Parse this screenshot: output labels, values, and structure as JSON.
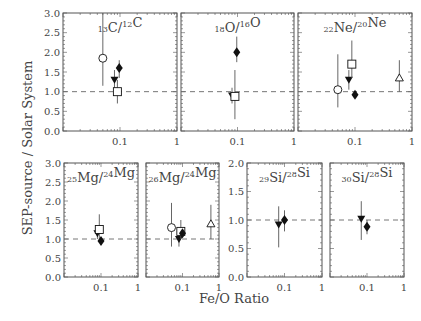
{
  "chart_data": {
    "type": "scatter",
    "ylabel": "SEP-source / Solar System",
    "xlabel": "Fe/O Ratio",
    "xscale": "log",
    "xlim": [
      0.01,
      1
    ],
    "x_tick_labels": [
      "0.1",
      "1"
    ],
    "grid": false,
    "reference_line": 1.0,
    "markers": {
      "open-circle": "open circle",
      "filled-triangle-down": "filled downward triangle",
      "open-square": "open square",
      "filled-diamond": "filled diamond",
      "open-triangle-up": "open upward triangle"
    },
    "panels": [
      {
        "id": "c13",
        "label_sup1": "13",
        "label_el1": "C",
        "label_sup2": "12",
        "label_el2": "C",
        "ylim": [
          0,
          3.0
        ],
        "y_ticks": [
          "0.0",
          "0.5",
          "1.0",
          "1.5",
          "2.0",
          "2.5",
          "3.0"
        ],
        "points": [
          {
            "marker": "open-circle",
            "x": 0.05,
            "y": 1.85,
            "ylo": 1.15,
            "yhi": 3.0
          },
          {
            "marker": "filled-triangle-down",
            "x": 0.08,
            "y": 1.3,
            "ylo": 1.05,
            "yhi": 1.55
          },
          {
            "marker": "open-square",
            "x": 0.09,
            "y": 1.0,
            "ylo": 0.7,
            "yhi": 1.3
          },
          {
            "marker": "filled-diamond",
            "x": 0.097,
            "y": 1.6,
            "ylo": 1.35,
            "yhi": 1.8
          }
        ]
      },
      {
        "id": "o18",
        "label_sup1": "18",
        "label_el1": "O",
        "label_sup2": "16",
        "label_el2": "O",
        "ylim": [
          0,
          3.0
        ],
        "y_ticks": [],
        "points": [
          {
            "marker": "filled-triangle-down",
            "x": 0.08,
            "y": 0.9,
            "ylo": 0.7,
            "yhi": 1.1
          },
          {
            "marker": "open-square",
            "x": 0.09,
            "y": 0.88,
            "ylo": 0.3,
            "yhi": 1.55
          },
          {
            "marker": "filled-diamond",
            "x": 0.097,
            "y": 2.0,
            "ylo": 1.75,
            "yhi": 2.4
          }
        ]
      },
      {
        "id": "ne22",
        "label_sup1": "22",
        "label_el1": "Ne",
        "label_sup2": "20",
        "label_el2": "Ne",
        "ylim": [
          0,
          3.0
        ],
        "y_ticks": [],
        "points": [
          {
            "marker": "open-circle",
            "x": 0.05,
            "y": 1.05,
            "ylo": 0.6,
            "yhi": 1.95
          },
          {
            "marker": "filled-triangle-down",
            "x": 0.078,
            "y": 1.3,
            "ylo": 1.05,
            "yhi": 1.55
          },
          {
            "marker": "open-square",
            "x": 0.088,
            "y": 1.7,
            "ylo": 1.35,
            "yhi": 2.3
          },
          {
            "marker": "filled-diamond",
            "x": 0.1,
            "y": 0.92,
            "ylo": 0.85,
            "yhi": 1.0
          },
          {
            "marker": "open-triangle-up",
            "x": 0.6,
            "y": 1.35,
            "ylo": 1.0,
            "yhi": 1.8
          }
        ]
      },
      {
        "id": "mg25",
        "label_sup1": "25",
        "label_el1": "Mg",
        "label_sup2": "24",
        "label_el2": "Mg",
        "ylim": [
          0,
          3.0
        ],
        "y_ticks": [
          "0.0",
          "0.5",
          "1.0",
          "1.5",
          "2.0",
          "2.5",
          "3.0"
        ],
        "points": [
          {
            "marker": "filled-triangle-down",
            "x": 0.08,
            "y": 1.15,
            "ylo": 1.0,
            "yhi": 1.3
          },
          {
            "marker": "open-square",
            "x": 0.09,
            "y": 1.25,
            "ylo": 0.95,
            "yhi": 1.65
          },
          {
            "marker": "filled-diamond",
            "x": 0.1,
            "y": 0.95,
            "ylo": 0.85,
            "yhi": 1.05
          }
        ]
      },
      {
        "id": "mg26",
        "label_sup1": "26",
        "label_el1": "Mg",
        "label_sup2": "24",
        "label_el2": "Mg",
        "ylim": [
          0,
          3.0
        ],
        "y_ticks": [],
        "points": [
          {
            "marker": "open-circle",
            "x": 0.05,
            "y": 1.3,
            "ylo": 0.8,
            "yhi": 1.95
          },
          {
            "marker": "filled-triangle-down",
            "x": 0.08,
            "y": 1.0,
            "ylo": 0.8,
            "yhi": 1.2
          },
          {
            "marker": "open-square",
            "x": 0.09,
            "y": 1.2,
            "ylo": 1.0,
            "yhi": 1.5
          },
          {
            "marker": "filled-diamond",
            "x": 0.1,
            "y": 1.15,
            "ylo": 1.05,
            "yhi": 1.25
          },
          {
            "marker": "open-triangle-up",
            "x": 0.6,
            "y": 1.4,
            "ylo": 1.0,
            "yhi": 1.9
          }
        ]
      },
      {
        "id": "si29",
        "label_sup1": "29",
        "label_el1": "Si",
        "label_sup2": "28",
        "label_el2": "Si",
        "ylim": [
          0,
          2.0
        ],
        "y_ticks": [
          "0.0",
          "0.5",
          "1.0",
          "1.5",
          "2.0"
        ],
        "points": [
          {
            "marker": "filled-triangle-down",
            "x": 0.07,
            "y": 0.92,
            "ylo": 0.52,
            "yhi": 1.24
          },
          {
            "marker": "filled-diamond",
            "x": 0.1,
            "y": 1.0,
            "ylo": 0.8,
            "yhi": 1.17
          }
        ]
      },
      {
        "id": "si30",
        "label_sup1": "30",
        "label_el1": "Si",
        "label_sup2": "28",
        "label_el2": "Si",
        "ylim": [
          0,
          2.0
        ],
        "y_ticks": [],
        "points": [
          {
            "marker": "filled-triangle-down",
            "x": 0.07,
            "y": 1.02,
            "ylo": 0.65,
            "yhi": 1.33
          },
          {
            "marker": "filled-diamond",
            "x": 0.1,
            "y": 0.88,
            "ylo": 0.75,
            "yhi": 1.0
          }
        ]
      }
    ]
  },
  "layout": {
    "panels": [
      {
        "x0": 63,
        "x1": 177,
        "y0": 13,
        "y1": 131
      },
      {
        "x0": 181,
        "x1": 294,
        "y0": 13,
        "y1": 131
      },
      {
        "x0": 298,
        "x1": 412,
        "y0": 13,
        "y1": 131
      },
      {
        "x0": 64,
        "x1": 138,
        "y0": 163,
        "y1": 277
      },
      {
        "x0": 146,
        "x1": 219,
        "y0": 163,
        "y1": 277
      },
      {
        "x0": 247,
        "x1": 322,
        "y0": 163,
        "y1": 277
      },
      {
        "x0": 330,
        "x1": 404,
        "y0": 163,
        "y1": 277
      }
    ],
    "line_color": "#555555",
    "dash_color": "#666666",
    "marker_color": "#111111"
  }
}
